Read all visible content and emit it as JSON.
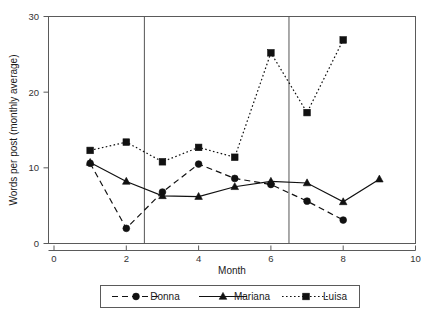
{
  "chart_data": {
    "type": "line",
    "title": "",
    "xlabel": "Month",
    "ylabel": "Words per post (monthly average)",
    "xlim": [
      0,
      10
    ],
    "ylim": [
      0,
      30
    ],
    "xticks": [
      0,
      2,
      4,
      6,
      8,
      10
    ],
    "yticks": [
      0,
      10,
      20,
      30
    ],
    "xtick_labels": [
      "0",
      "2",
      "4",
      "6",
      "8",
      "10"
    ],
    "ytick_labels": [
      "0",
      "10",
      "20",
      "30"
    ],
    "grid": false,
    "legend_position": "below",
    "phase_dividers": [
      2.5,
      6.5
    ],
    "series": [
      {
        "name": "Donna",
        "marker": "circle",
        "linestyle": "dashed",
        "color": "#111111",
        "x": [
          1,
          2,
          3,
          4,
          5,
          6,
          7,
          8
        ],
        "values": [
          10.6,
          2.0,
          6.8,
          10.5,
          8.6,
          7.8,
          5.6,
          3.1
        ]
      },
      {
        "name": "Mariana",
        "marker": "triangle",
        "linestyle": "solid",
        "color": "#111111",
        "x": [
          1,
          2,
          3,
          4,
          5,
          6,
          7,
          8,
          9
        ],
        "values": [
          10.7,
          8.2,
          6.3,
          6.2,
          7.5,
          8.2,
          8.0,
          5.5,
          8.5
        ]
      },
      {
        "name": "Luisa",
        "marker": "square",
        "linestyle": "dotted",
        "color": "#111111",
        "x": [
          1,
          2,
          3,
          4,
          5,
          6,
          7,
          8
        ],
        "values": [
          12.3,
          13.4,
          10.8,
          12.7,
          11.4,
          25.2,
          17.3,
          26.9
        ]
      }
    ]
  },
  "axes": {
    "x_title": "Month",
    "y_title": "Words per post (monthly average)"
  },
  "legend": {
    "entries": [
      {
        "label": "Donna"
      },
      {
        "label": "Mariana"
      },
      {
        "label": "Luisa"
      }
    ]
  },
  "colors": {
    "ink": "#111111",
    "frame": "#5a5a5a",
    "background": "#ffffff"
  }
}
